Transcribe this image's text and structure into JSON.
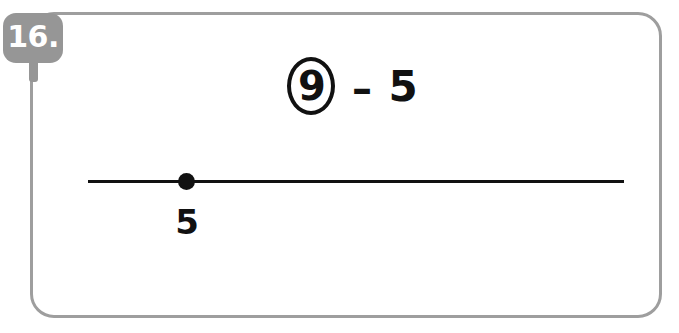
{
  "problem": {
    "number_label": "16.",
    "expression": {
      "circled_operand": "9",
      "operator": "–",
      "operand": "5",
      "full_text": "9 – 5"
    },
    "number_line": {
      "point_label": "5",
      "point_value": 5
    }
  },
  "colors": {
    "badge_gray": "#969696",
    "card_border_gray": "#9e9e9e",
    "ink_black": "#111111",
    "background": "#ffffff"
  }
}
